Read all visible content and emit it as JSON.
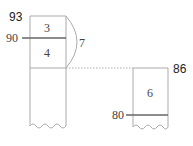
{
  "diagram": {
    "left_column": {
      "top_label": "93",
      "mark_label": "90",
      "segment_upper": "3",
      "segment_lower": "4",
      "brace_total": "7"
    },
    "right_column": {
      "top_label": "86",
      "mark_label": "80",
      "segment": "6"
    },
    "colors": {
      "stroke": "#999999",
      "mark_line": "#666666",
      "text": "#222222"
    }
  }
}
